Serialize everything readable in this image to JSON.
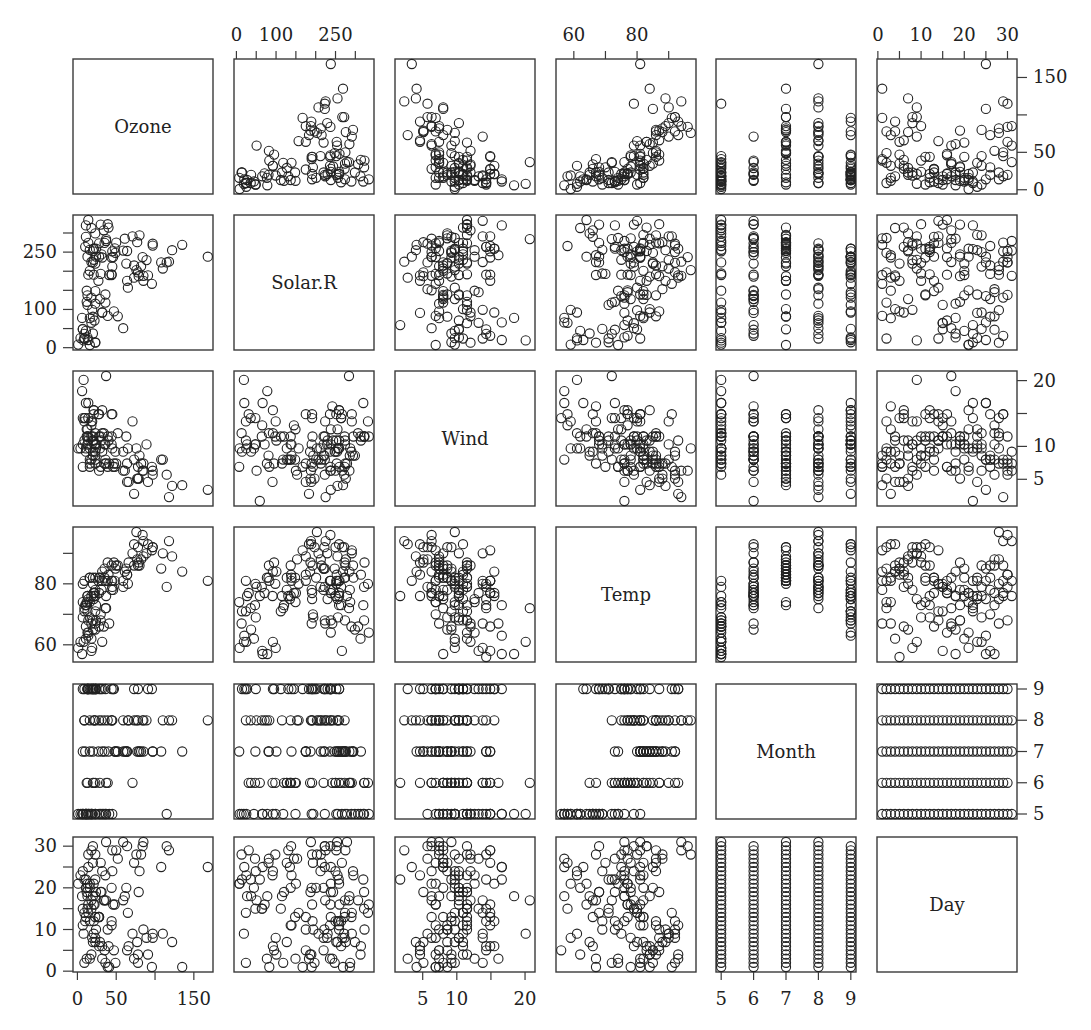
{
  "chart_data": {
    "type": "scatter",
    "subtype": "scatterplot-matrix",
    "title": "",
    "variables": [
      "Ozone",
      "Solar.R",
      "Wind",
      "Temp",
      "Month",
      "Day"
    ],
    "axes": {
      "Ozone": {
        "range": [
          1,
          168
        ],
        "ticks": [
          0,
          50,
          100,
          150
        ],
        "labels": [
          "0",
          "50",
          "",
          "150"
        ]
      },
      "Solar.R": {
        "range": [
          7,
          334
        ],
        "ticks": [
          0,
          50,
          100,
          150,
          200,
          250,
          300
        ],
        "labels": [
          "0",
          "",
          "100",
          "",
          "",
          "250",
          ""
        ]
      },
      "Wind": {
        "range": [
          1.7,
          20.7
        ],
        "ticks": [
          5,
          10,
          15,
          20
        ],
        "labels": [
          "5",
          "10",
          "",
          "20"
        ]
      },
      "Temp": {
        "range": [
          56,
          97
        ],
        "ticks": [
          60,
          70,
          80,
          90
        ],
        "labels": [
          "60",
          "",
          "80",
          ""
        ]
      },
      "Month": {
        "range": [
          5,
          9
        ],
        "ticks": [
          5,
          6,
          7,
          8,
          9
        ],
        "labels": [
          "5",
          "6",
          "7",
          "8",
          "9"
        ]
      },
      "Day": {
        "range": [
          1,
          31
        ],
        "ticks": [
          0,
          5,
          10,
          15,
          20,
          25,
          30
        ],
        "labels": [
          "0",
          "",
          "10",
          "",
          "20",
          "",
          "30"
        ]
      }
    },
    "axis_placement": {
      "top": [
        "Solar.R",
        "Temp",
        "Day"
      ],
      "bottom": [
        "Ozone",
        "Wind",
        "Month"
      ],
      "left": [
        "Solar.R",
        "Temp",
        "Day"
      ],
      "right": [
        "Ozone",
        "Wind",
        "Month"
      ]
    },
    "grid": false,
    "legend": null,
    "marker": "open-circle",
    "data": {
      "Ozone": [
        41,
        36,
        12,
        18,
        null,
        28,
        23,
        19,
        8,
        null,
        7,
        16,
        11,
        14,
        18,
        14,
        34,
        6,
        30,
        11,
        1,
        11,
        4,
        32,
        null,
        null,
        null,
        23,
        45,
        115,
        37,
        null,
        null,
        null,
        null,
        null,
        null,
        29,
        null,
        71,
        39,
        null,
        null,
        23,
        null,
        null,
        21,
        37,
        20,
        12,
        13,
        null,
        null,
        null,
        null,
        null,
        null,
        null,
        null,
        null,
        null,
        135,
        49,
        32,
        null,
        64,
        40,
        77,
        97,
        97,
        85,
        null,
        10,
        27,
        null,
        7,
        48,
        35,
        61,
        79,
        63,
        16,
        null,
        null,
        80,
        108,
        20,
        52,
        82,
        50,
        64,
        59,
        39,
        9,
        16,
        78,
        35,
        66,
        122,
        89,
        110,
        null,
        null,
        44,
        28,
        65,
        null,
        22,
        59,
        23,
        31,
        44,
        21,
        9,
        null,
        45,
        168,
        73,
        null,
        76,
        118,
        84,
        85,
        96,
        78,
        73,
        91,
        47,
        32,
        20,
        23,
        21,
        24,
        44,
        21,
        28,
        9,
        13,
        46,
        18,
        13,
        24,
        16,
        13,
        23,
        36,
        7,
        14,
        30,
        null,
        14,
        18,
        20
      ],
      "Solar.R": [
        190,
        118,
        149,
        313,
        null,
        null,
        299,
        99,
        19,
        194,
        null,
        256,
        290,
        274,
        65,
        334,
        307,
        78,
        322,
        44,
        8,
        320,
        25,
        92,
        66,
        266,
        null,
        13,
        252,
        223,
        279,
        286,
        287,
        242,
        186,
        220,
        264,
        127,
        273,
        291,
        323,
        259,
        250,
        148,
        332,
        322,
        191,
        284,
        37,
        120,
        137,
        150,
        59,
        91,
        250,
        135,
        127,
        47,
        98,
        31,
        138,
        269,
        248,
        236,
        101,
        175,
        314,
        276,
        267,
        272,
        175,
        139,
        264,
        175,
        291,
        48,
        260,
        274,
        285,
        187,
        220,
        7,
        258,
        295,
        294,
        223,
        81,
        82,
        213,
        275,
        253,
        254,
        83,
        24,
        77,
        null,
        null,
        null,
        255,
        229,
        207,
        222,
        137,
        192,
        273,
        157,
        64,
        71,
        51,
        115,
        244,
        190,
        259,
        36,
        255,
        212,
        238,
        215,
        153,
        203,
        225,
        237,
        188,
        167,
        197,
        183,
        189,
        95,
        92,
        252,
        220,
        230,
        259,
        236,
        259,
        238,
        24,
        112,
        237,
        224,
        27,
        238,
        201,
        238,
        14,
        139,
        49,
        20,
        193,
        145,
        191,
        131,
        223
      ],
      "Wind": [
        7.4,
        8.0,
        12.6,
        11.5,
        14.3,
        14.9,
        8.6,
        13.8,
        20.1,
        8.6,
        6.9,
        9.7,
        9.2,
        10.9,
        13.2,
        11.5,
        12.0,
        18.4,
        11.5,
        9.7,
        9.7,
        16.6,
        9.7,
        12.0,
        16.6,
        14.9,
        8.0,
        12.0,
        14.9,
        5.7,
        7.4,
        8.6,
        9.7,
        16.1,
        9.2,
        8.6,
        14.3,
        9.7,
        6.9,
        13.8,
        11.5,
        10.9,
        9.2,
        8.0,
        13.8,
        11.5,
        14.9,
        20.7,
        9.2,
        11.5,
        10.3,
        6.3,
        1.7,
        4.6,
        6.3,
        8.0,
        8.0,
        10.3,
        11.5,
        14.9,
        8.0,
        4.1,
        9.2,
        9.2,
        10.9,
        4.6,
        10.9,
        5.1,
        6.3,
        5.7,
        7.4,
        8.6,
        14.3,
        14.9,
        14.9,
        14.3,
        6.9,
        10.3,
        6.3,
        5.1,
        11.5,
        6.9,
        9.7,
        11.5,
        8.6,
        8.0,
        8.6,
        12.0,
        7.4,
        7.4,
        7.4,
        9.2,
        6.9,
        13.8,
        7.4,
        6.9,
        7.4,
        4.6,
        4.0,
        10.3,
        8.0,
        8.6,
        11.5,
        11.5,
        11.5,
        9.7,
        11.5,
        10.3,
        6.3,
        7.4,
        10.9,
        10.3,
        15.5,
        14.3,
        12.6,
        9.7,
        3.4,
        8.0,
        5.7,
        9.7,
        2.3,
        6.3,
        6.3,
        6.9,
        5.1,
        2.8,
        4.6,
        7.4,
        15.5,
        10.9,
        10.3,
        10.9,
        9.7,
        14.9,
        15.5,
        6.3,
        10.9,
        11.5,
        6.9,
        13.8,
        10.3,
        10.3,
        8.0,
        12.6,
        9.2,
        10.3,
        10.3,
        16.6,
        6.9,
        13.2,
        14.3,
        8.0,
        11.5
      ],
      "Temp": [
        67,
        72,
        74,
        62,
        56,
        66,
        65,
        59,
        61,
        69,
        74,
        69,
        66,
        68,
        58,
        64,
        66,
        57,
        68,
        62,
        59,
        73,
        61,
        61,
        57,
        58,
        57,
        67,
        81,
        79,
        76,
        78,
        74,
        67,
        84,
        85,
        79,
        82,
        87,
        90,
        87,
        93,
        92,
        82,
        80,
        79,
        77,
        72,
        65,
        73,
        76,
        77,
        76,
        76,
        76,
        75,
        78,
        73,
        80,
        77,
        83,
        84,
        85,
        81,
        84,
        83,
        83,
        88,
        92,
        92,
        89,
        82,
        73,
        81,
        91,
        80,
        81,
        82,
        84,
        87,
        85,
        74,
        81,
        82,
        86,
        85,
        82,
        86,
        88,
        86,
        83,
        81,
        81,
        81,
        82,
        86,
        85,
        87,
        89,
        90,
        90,
        92,
        86,
        86,
        82,
        80,
        79,
        77,
        79,
        76,
        78,
        78,
        77,
        72,
        75,
        79,
        81,
        86,
        88,
        97,
        94,
        96,
        94,
        91,
        92,
        93,
        93,
        87,
        84,
        80,
        78,
        75,
        73,
        81,
        76,
        77,
        71,
        71,
        78,
        67,
        76,
        68,
        82,
        64,
        71,
        81,
        69,
        63,
        70,
        77,
        75,
        76,
        68
      ],
      "Month": [
        5,
        5,
        5,
        5,
        5,
        5,
        5,
        5,
        5,
        5,
        5,
        5,
        5,
        5,
        5,
        5,
        5,
        5,
        5,
        5,
        5,
        5,
        5,
        5,
        5,
        5,
        5,
        5,
        5,
        5,
        5,
        6,
        6,
        6,
        6,
        6,
        6,
        6,
        6,
        6,
        6,
        6,
        6,
        6,
        6,
        6,
        6,
        6,
        6,
        6,
        6,
        6,
        6,
        6,
        6,
        6,
        6,
        6,
        6,
        6,
        6,
        7,
        7,
        7,
        7,
        7,
        7,
        7,
        7,
        7,
        7,
        7,
        7,
        7,
        7,
        7,
        7,
        7,
        7,
        7,
        7,
        7,
        7,
        7,
        7,
        7,
        7,
        7,
        7,
        7,
        7,
        7,
        8,
        8,
        8,
        8,
        8,
        8,
        8,
        8,
        8,
        8,
        8,
        8,
        8,
        8,
        8,
        8,
        8,
        8,
        8,
        8,
        8,
        8,
        8,
        8,
        8,
        8,
        8,
        8,
        8,
        8,
        8,
        9,
        9,
        9,
        9,
        9,
        9,
        9,
        9,
        9,
        9,
        9,
        9,
        9,
        9,
        9,
        9,
        9,
        9,
        9,
        9,
        9,
        9,
        9,
        9,
        9,
        9,
        9,
        9,
        9,
        9
      ],
      "Day": [
        1,
        2,
        3,
        4,
        5,
        6,
        7,
        8,
        9,
        10,
        11,
        12,
        13,
        14,
        15,
        16,
        17,
        18,
        19,
        20,
        21,
        22,
        23,
        24,
        25,
        26,
        27,
        28,
        29,
        30,
        31,
        1,
        2,
        3,
        4,
        5,
        6,
        7,
        8,
        9,
        10,
        11,
        12,
        13,
        14,
        15,
        16,
        17,
        18,
        19,
        20,
        21,
        22,
        23,
        24,
        25,
        26,
        27,
        28,
        29,
        30,
        1,
        2,
        3,
        4,
        5,
        6,
        7,
        8,
        9,
        10,
        11,
        12,
        13,
        14,
        15,
        16,
        17,
        18,
        19,
        20,
        21,
        22,
        23,
        24,
        25,
        26,
        27,
        28,
        29,
        30,
        31,
        1,
        2,
        3,
        4,
        5,
        6,
        7,
        8,
        9,
        10,
        11,
        12,
        13,
        14,
        15,
        16,
        17,
        18,
        19,
        20,
        21,
        22,
        23,
        24,
        25,
        26,
        27,
        28,
        29,
        30,
        31,
        1,
        2,
        3,
        4,
        5,
        6,
        7,
        8,
        9,
        10,
        11,
        12,
        13,
        14,
        15,
        16,
        17,
        18,
        19,
        20,
        21,
        22,
        23,
        24,
        25,
        26,
        27,
        28,
        29,
        30
      ]
    }
  },
  "layout": {
    "panel_x": [
      73,
      234,
      395,
      556,
      716,
      877
    ],
    "panel_y": [
      59,
      215,
      371,
      527,
      684,
      837
    ],
    "panel_w": 140,
    "panel_h": 135,
    "pad": 0.04,
    "point_r": 4.6
  }
}
